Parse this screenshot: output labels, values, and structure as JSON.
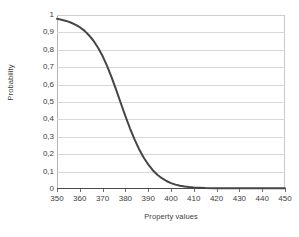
{
  "chart_data": {
    "type": "line",
    "title": "",
    "xlabel": "Property values",
    "ylabel": "Probability",
    "xlim": [
      350,
      450
    ],
    "ylim": [
      0,
      1
    ],
    "grid": "horizontal",
    "legend": "none",
    "line_color": "#454545",
    "gridline_color": "#d8d8d8",
    "axis_color": "#4a4a4a",
    "x_ticks": [
      350,
      360,
      370,
      380,
      390,
      400,
      410,
      420,
      430,
      440,
      450
    ],
    "x_tick_labels": [
      "350",
      "360",
      "370",
      "380",
      "390",
      "400",
      "410",
      "420",
      "430",
      "440",
      "450"
    ],
    "y_ticks": [
      0,
      0.1,
      0.2,
      0.3,
      0.4,
      0.5,
      0.6,
      0.7,
      0.8,
      0.9,
      1
    ],
    "y_tick_labels": [
      "0",
      "0,1",
      "0,2",
      "0,3",
      "0,4",
      "0,5",
      "0,6",
      "0,7",
      "0,8",
      "0,9",
      "1"
    ],
    "series": [
      {
        "name": "Probability",
        "x": [
          350,
          352,
          354,
          356,
          358,
          360,
          362,
          364,
          366,
          368,
          370,
          372,
          374,
          376,
          378,
          380,
          382,
          384,
          386,
          388,
          390,
          392,
          394,
          396,
          398,
          400,
          402,
          404,
          406,
          408,
          410,
          415,
          420,
          425,
          430,
          435,
          440,
          445,
          450
        ],
        "y": [
          0.978,
          0.973,
          0.966,
          0.957,
          0.945,
          0.93,
          0.91,
          0.884,
          0.852,
          0.812,
          0.764,
          0.706,
          0.64,
          0.568,
          0.493,
          0.419,
          0.349,
          0.285,
          0.229,
          0.181,
          0.141,
          0.108,
          0.082,
          0.062,
          0.046,
          0.034,
          0.025,
          0.019,
          0.014,
          0.011,
          0.009,
          0.006,
          0.005,
          0.005,
          0.005,
          0.005,
          0.005,
          0.005,
          0.005
        ]
      }
    ]
  }
}
